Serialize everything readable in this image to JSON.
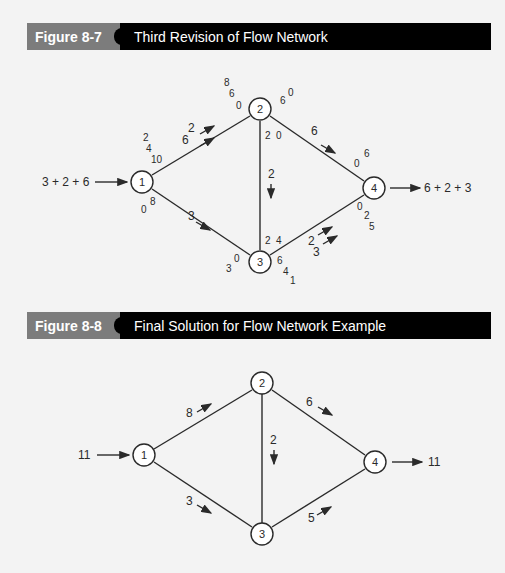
{
  "figure_8_7": {
    "number": "Figure 8-7",
    "title": "Third Revision of Flow Network",
    "source_label": "3 + 2 + 6",
    "sink_label": "6 + 2 + 3",
    "nodes": [
      "1",
      "2",
      "3",
      "4"
    ],
    "edges": {
      "e12": {
        "flow_labels": [
          "2",
          "6"
        ],
        "cap_at_1": [
          "2",
          "4",
          "10"
        ],
        "cap_at_2": [
          "8",
          "6",
          "0"
        ]
      },
      "e13": {
        "flow_label": "3",
        "cap_at_1": [
          "0",
          "8"
        ],
        "cap_at_3": [
          "3",
          "0"
        ]
      },
      "e23": {
        "flow_label": "2",
        "cap_at_2": [
          "2",
          "0"
        ],
        "cap_at_3": [
          "2",
          "4"
        ]
      },
      "e24": {
        "flow_label": "6",
        "cap_at_2": [
          "6",
          "0"
        ],
        "cap_at_4": [
          "0",
          "6"
        ]
      },
      "e34": {
        "flow_labels": [
          "2",
          "3"
        ],
        "cap_at_3": [
          "6",
          "4",
          "1"
        ],
        "cap_at_4": [
          "0",
          "2",
          "5"
        ]
      }
    }
  },
  "figure_8_8": {
    "number": "Figure 8-8",
    "title": "Final Solution for Flow Network Example",
    "source_label": "11",
    "sink_label": "11",
    "nodes": [
      "1",
      "2",
      "3",
      "4"
    ],
    "edges": {
      "e12": {
        "flow_label": "8"
      },
      "e13": {
        "flow_label": "3"
      },
      "e23": {
        "flow_label": "2"
      },
      "e24": {
        "flow_label": "6"
      },
      "e34": {
        "flow_label": "5"
      }
    }
  },
  "colors": {
    "header_gray": "#7c7c7c",
    "header_black": "#000000",
    "background": "#f3f3f3",
    "line": "#2a2a2a"
  }
}
